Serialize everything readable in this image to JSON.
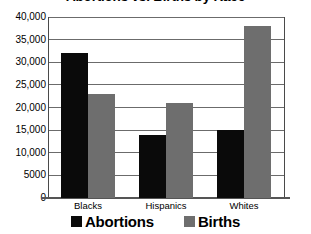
{
  "chart_data": {
    "type": "bar",
    "title": "Abortions vs. Births by Race",
    "xlabel": "",
    "ylabel": "",
    "categories": [
      "Blacks",
      "Hispanics",
      "Whites"
    ],
    "series": [
      {
        "name": "Abortions",
        "color": "#0a0a0a",
        "values": [
          32000,
          14000,
          15000
        ]
      },
      {
        "name": "Births",
        "color": "#6e6e6e",
        "values": [
          23000,
          21000,
          38000
        ]
      }
    ],
    "ylim": [
      0,
      40000
    ],
    "ytick_values": [
      0,
      5000,
      10000,
      15000,
      20000,
      25000,
      30000,
      35000,
      40000
    ],
    "ytick_labels": [
      "0",
      "5000",
      "10,000",
      "15,000",
      "20,000",
      "25,000",
      "30,000",
      "35,000",
      "40,000"
    ],
    "grid": true,
    "legend_position": "bottom"
  }
}
